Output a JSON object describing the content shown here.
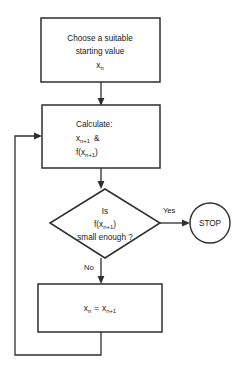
{
  "diagram": {
    "colors": {
      "stroke": "#2e2e2e",
      "fill": "#ffffff",
      "text": "#1a1a1a"
    },
    "nodes": {
      "start": {
        "shape": "process",
        "line1": "Choose a suitable",
        "line2": "starting value",
        "line3_base": "x",
        "line3_sub": "n"
      },
      "calculate": {
        "shape": "process",
        "line1": "Calculate:",
        "line2_base": "x",
        "line2_sub": "n+1",
        "line2_tail": "&",
        "line3_base": "f(x",
        "line3_sub": "n+1",
        "line3_tail": ")"
      },
      "decision": {
        "shape": "diamond",
        "line1": "Is",
        "line2_base": "f(x",
        "line2_sub": "n+1",
        "line2_tail": ")",
        "line3": "small enough ?"
      },
      "update": {
        "shape": "process",
        "base_left": "x",
        "sub_left": "n",
        "operator": "=",
        "base_right": "x",
        "sub_right": "n+1"
      },
      "stop": {
        "shape": "terminator-circle",
        "label": "STOP"
      }
    },
    "edges": {
      "yes_label": "Yes",
      "no_label": "No"
    }
  }
}
